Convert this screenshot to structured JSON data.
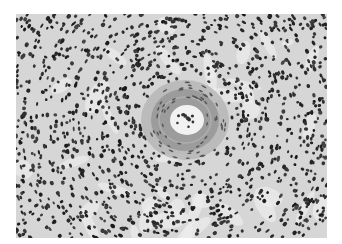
{
  "image": {
    "type": "grayscale histology micrograph",
    "background": "#ffffff",
    "tissue_base": "#d8d8d8",
    "nucleus_color": "#2a2a2a",
    "vessel_wall_color": "#9a9a9a",
    "lumen_color": "#f4f4f4",
    "vessel_center": [
      169,
      106
    ],
    "vessel_outer_radius": 40,
    "lumen_radius": [
      17,
      15
    ]
  }
}
